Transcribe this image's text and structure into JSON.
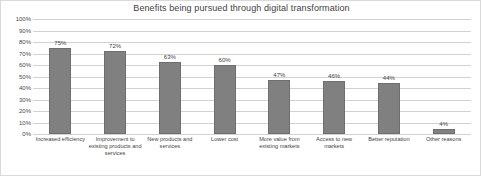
{
  "chart_data": {
    "type": "bar",
    "title": "Benefits being pursued through digital transformation",
    "xlabel": "",
    "ylabel": "",
    "ylim": [
      0,
      100
    ],
    "yticks": [
      "0%",
      "10%",
      "20%",
      "30%",
      "40%",
      "50%",
      "60%",
      "70%",
      "80%",
      "90%",
      "100%"
    ],
    "grid": true,
    "legend": "none",
    "categories": [
      "Increased efficiency",
      "Improvement to existing products and services",
      "New products and services",
      "Lower cost",
      "More value from existing markets",
      "Access to new markets",
      "Better reputation",
      "Other reasons"
    ],
    "values": [
      75,
      72,
      63,
      60,
      47,
      46,
      44,
      4
    ],
    "value_labels": [
      "75%",
      "72%",
      "63%",
      "60%",
      "47%",
      "46%",
      "44%",
      "4%"
    ],
    "bar_color": "#808080",
    "grid_color": "#d2d2d2",
    "text_color": "#3f3f3f"
  }
}
